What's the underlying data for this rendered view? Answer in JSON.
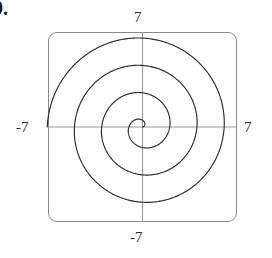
{
  "exercise": {
    "number_label": "9."
  },
  "screen": {
    "frame_style": "rounded-rectangle",
    "border_color": "#8a8a8a",
    "background_color": "#ffffff"
  },
  "axes": {
    "x_axis_color": "#9a9a9a",
    "y_axis_color": "#9a9a9a",
    "labels": {
      "x_min": "-7",
      "x_max": "7",
      "y_min": "-7",
      "y_max": "7"
    }
  },
  "chart_data": {
    "type": "line",
    "title": "",
    "subtitle": "",
    "xlabel": "",
    "ylabel": "",
    "xlim": [
      -7,
      7
    ],
    "ylim": [
      -7,
      7
    ],
    "grid": false,
    "legend": "none",
    "coordinate_system": "polar",
    "curve_color": "#2b2b2b",
    "series": [
      {
        "name": "spiral",
        "polar_form": "r = a*theta",
        "theta_range_deg": [
          0,
          1260
        ],
        "theta_unit": "degrees",
        "a": 0.0056,
        "x": [
          0.0,
          0.34,
          0.48,
          0.35,
          0.0,
          -0.49,
          -0.97,
          -1.19,
          -0.97,
          -0.34,
          0.49,
          1.32,
          1.94,
          2.12,
          1.7,
          0.69,
          -0.68,
          -2.08,
          -3.07,
          -3.35,
          -2.73,
          -1.32,
          0.49,
          2.27,
          3.55,
          3.97,
          3.39,
          1.95,
          0.0,
          -2.06,
          -3.77,
          -4.72,
          -4.66,
          -3.63,
          -1.92,
          0.0
        ],
        "y": [
          0.0,
          0.12,
          0.48,
          0.85,
          0.97,
          0.85,
          0.49,
          0.0,
          -0.56,
          -0.94,
          -1.36,
          -1.32,
          -0.7,
          0.37,
          1.7,
          2.59,
          2.68,
          2.08,
          1.06,
          -0.29,
          -1.58,
          -2.45,
          -3.0,
          -2.73,
          -1.69,
          0.0,
          1.96,
          3.38,
          4.1,
          3.99,
          3.06,
          1.26,
          -1.25,
          -3.05,
          -4.22,
          -4.6
        ]
      }
    ]
  }
}
